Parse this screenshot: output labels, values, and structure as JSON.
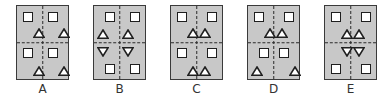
{
  "figure": {
    "panel_fill": "#c8c8c8",
    "stroke": "#1f1f1f",
    "options": [
      {
        "label": "A",
        "left": 16,
        "shapes": [
          {
            "type": "square",
            "x": 6,
            "y": 6
          },
          {
            "type": "tri-up",
            "x": 16,
            "y": 22
          },
          {
            "type": "square",
            "x": 31,
            "y": 6
          },
          {
            "type": "tri-up",
            "x": 41,
            "y": 22
          },
          {
            "type": "square",
            "x": 6,
            "y": 42
          },
          {
            "type": "tri-up",
            "x": 16,
            "y": 60
          },
          {
            "type": "square",
            "x": 31,
            "y": 42
          },
          {
            "type": "tri-up",
            "x": 41,
            "y": 60
          }
        ]
      },
      {
        "label": "B",
        "left": 93,
        "shapes": [
          {
            "type": "square",
            "x": 11,
            "y": 6
          },
          {
            "type": "tri-up",
            "x": 3,
            "y": 23
          },
          {
            "type": "square",
            "x": 36,
            "y": 6
          },
          {
            "type": "tri-up",
            "x": 28,
            "y": 23
          },
          {
            "type": "tri-down",
            "x": 3,
            "y": 41
          },
          {
            "type": "square",
            "x": 11,
            "y": 58
          },
          {
            "type": "tri-down",
            "x": 28,
            "y": 41
          },
          {
            "type": "square",
            "x": 36,
            "y": 58
          }
        ]
      },
      {
        "label": "C",
        "left": 170,
        "shapes": [
          {
            "type": "square",
            "x": 6,
            "y": 6
          },
          {
            "type": "tri-up",
            "x": 16,
            "y": 22
          },
          {
            "type": "square",
            "x": 36,
            "y": 6
          },
          {
            "type": "tri-up",
            "x": 28,
            "y": 22
          },
          {
            "type": "square",
            "x": 6,
            "y": 42
          },
          {
            "type": "tri-up",
            "x": 16,
            "y": 60
          },
          {
            "type": "square",
            "x": 36,
            "y": 42
          },
          {
            "type": "tri-up",
            "x": 28,
            "y": 60
          }
        ]
      },
      {
        "label": "D",
        "left": 247,
        "shapes": [
          {
            "type": "square",
            "x": 6,
            "y": 6
          },
          {
            "type": "tri-up",
            "x": 16,
            "y": 22
          },
          {
            "type": "square",
            "x": 36,
            "y": 6
          },
          {
            "type": "tri-up",
            "x": 28,
            "y": 22
          },
          {
            "type": "square",
            "x": 11,
            "y": 42
          },
          {
            "type": "tri-up",
            "x": 3,
            "y": 60
          },
          {
            "type": "square",
            "x": 31,
            "y": 42
          },
          {
            "type": "tri-up",
            "x": 41,
            "y": 60
          }
        ]
      },
      {
        "label": "E",
        "left": 324,
        "shapes": [
          {
            "type": "square",
            "x": 6,
            "y": 6
          },
          {
            "type": "tri-up",
            "x": 16,
            "y": 23
          },
          {
            "type": "square",
            "x": 36,
            "y": 6
          },
          {
            "type": "tri-up",
            "x": 28,
            "y": 23
          },
          {
            "type": "tri-down",
            "x": 16,
            "y": 41
          },
          {
            "type": "square",
            "x": 6,
            "y": 58
          },
          {
            "type": "tri-down",
            "x": 28,
            "y": 41
          },
          {
            "type": "square",
            "x": 36,
            "y": 58
          }
        ]
      }
    ]
  }
}
